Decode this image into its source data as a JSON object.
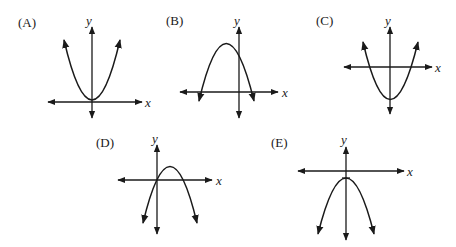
{
  "graphs": [
    {
      "id": "A",
      "label": "(A)",
      "x_axis": "x",
      "y_axis": "y",
      "description": "upward parabola, vertex just above x-axis on y-axis"
    },
    {
      "id": "B",
      "label": "(B)",
      "x_axis": "x",
      "y_axis": "y",
      "description": "downward parabola, vertex left of y-axis above x-axis"
    },
    {
      "id": "C",
      "label": "(C)",
      "x_axis": "x",
      "y_axis": "y",
      "description": "upward parabola, vertex below x-axis on y-axis"
    },
    {
      "id": "D",
      "label": "(D)",
      "x_axis": "x",
      "y_axis": "y",
      "description": "downward parabola through origin, vertex right of y-axis"
    },
    {
      "id": "E",
      "label": "(E)",
      "x_axis": "x",
      "y_axis": "y",
      "description": "downward parabola, vertex just below x-axis on y-axis"
    }
  ],
  "colors": {
    "ink": "#1a1a1a",
    "background": "#ffffff"
  }
}
